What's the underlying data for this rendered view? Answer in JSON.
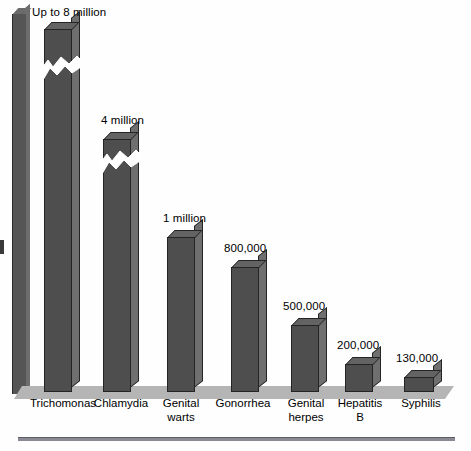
{
  "chart_data": {
    "type": "bar",
    "title": "",
    "subtitle": "",
    "xlabel": "",
    "ylabel": "",
    "legend": [],
    "grid": false,
    "axis_note": "vertical axis drawn as a 3D slab with no tick labels; two tallest bars use zig-zag scale breaks",
    "categories": [
      "Trichomonas",
      "Chlamydia",
      "Genital\nwarts",
      "Gonorrhea",
      "Genital\nherpes",
      "Hepatitis\nB",
      "Syphilis"
    ],
    "value_labels": [
      "Up to 8 million",
      "4 million",
      "1 million",
      "800,000",
      "500,000",
      "200,000",
      "130,000"
    ],
    "values": [
      8000000,
      4000000,
      1000000,
      800000,
      500000,
      200000,
      130000
    ],
    "scale_break": [
      true,
      true,
      false,
      false,
      false,
      false,
      false
    ],
    "ylim": [
      0,
      8000000
    ],
    "colors": {
      "bar_front": "#4e4e4e",
      "bar_side": "#6f6f6f",
      "bar_top": "#636363",
      "bar_outline": "#242424",
      "floor": "#b5b5b5",
      "axis_slab": "#555555",
      "rule": "#8a8a94",
      "background": "#fefefe",
      "text": "#000000"
    }
  },
  "bars": [
    {
      "name": "trichomonas",
      "label": "Trichomonas",
      "value_label": "Up to 8 million",
      "left": 44,
      "top": 22,
      "width": 28,
      "cat_left": 30,
      "cat_top": 397,
      "val_left": 32,
      "val_top": 6,
      "break_top": 56,
      "has_break": true
    },
    {
      "name": "chlamydia",
      "label": "Chlamydia",
      "value_label": "4 million",
      "left": 103,
      "top": 132,
      "width": 28,
      "cat_left": 92,
      "cat_top": 397,
      "val_left": 101,
      "val_top": 114,
      "break_top": 150,
      "has_break": true
    },
    {
      "name": "genital-warts",
      "label": "Genital\nwarts",
      "value_label": "1 million",
      "left": 167,
      "top": 230,
      "width": 28,
      "cat_left": 152,
      "cat_top": 397,
      "val_left": 163,
      "val_top": 212,
      "break_top": 0,
      "has_break": false
    },
    {
      "name": "gonorrhea",
      "label": "Gonorrhea",
      "value_label": "800,000",
      "left": 231,
      "top": 260,
      "width": 28,
      "cat_left": 214,
      "cat_top": 397,
      "val_left": 224,
      "val_top": 242,
      "break_top": 0,
      "has_break": false
    },
    {
      "name": "genital-herpes",
      "label": "Genital\nherpes",
      "value_label": "500,000",
      "left": 291,
      "top": 318,
      "width": 28,
      "cat_left": 277,
      "cat_top": 397,
      "val_left": 283,
      "val_top": 300,
      "break_top": 0,
      "has_break": false
    },
    {
      "name": "hepatitis-b",
      "label": "Hepatitis\nB",
      "value_label": "200,000",
      "left": 345,
      "top": 357,
      "width": 28,
      "cat_left": 331,
      "cat_top": 397,
      "val_left": 337,
      "val_top": 339,
      "break_top": 0,
      "has_break": false
    },
    {
      "name": "syphilis",
      "label": "Syphilis",
      "value_label": "130,000",
      "left": 404,
      "top": 370,
      "width": 30,
      "cat_left": 391,
      "cat_top": 397,
      "val_left": 396,
      "val_top": 352,
      "break_top": 0,
      "has_break": false
    }
  ],
  "baseline_y": 392
}
